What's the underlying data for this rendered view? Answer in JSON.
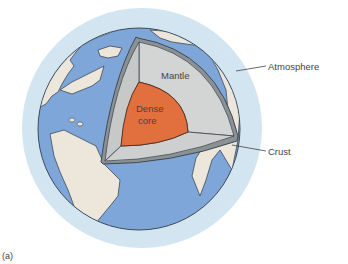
{
  "figure": {
    "panel_label": "(a)",
    "labels": {
      "atmosphere": "Atmosphere",
      "crust": "Crust",
      "mantle": "Mantle",
      "core_line1": "Dense",
      "core_line2": "core"
    },
    "colors": {
      "atmosphere": "#d2e5f1",
      "ocean": "#7ea6d8",
      "land": "#ece7da",
      "mantle": "#cfd2d1",
      "crust": "#8e9193",
      "core": "#e2703f",
      "outline": "#3d4a55"
    }
  }
}
